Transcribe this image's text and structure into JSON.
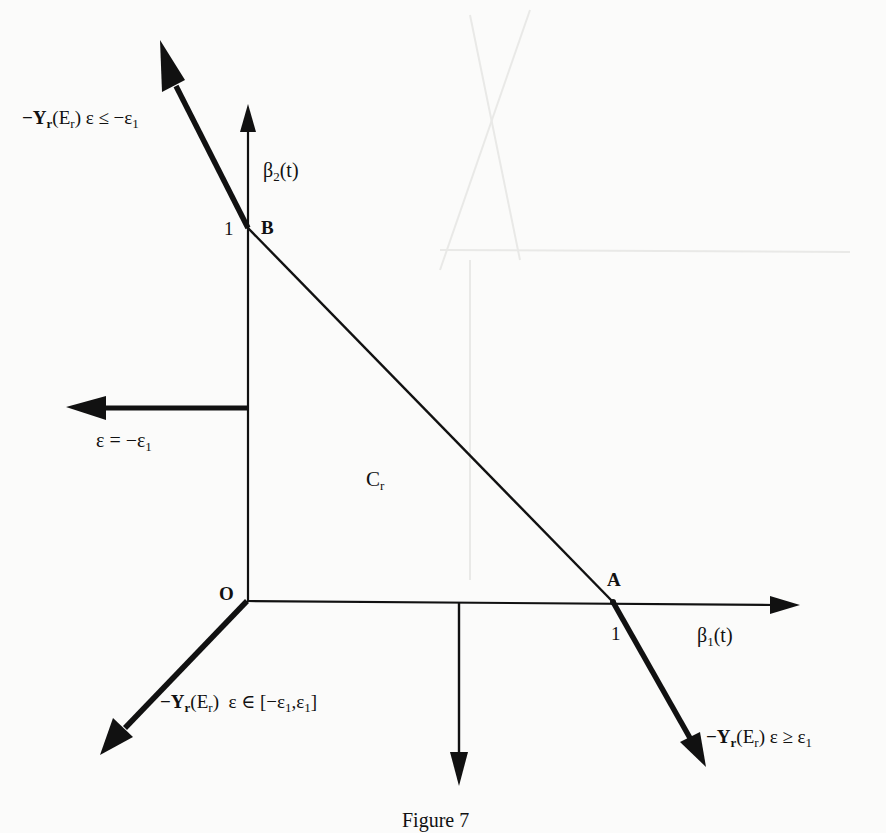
{
  "figure": {
    "caption": "Figure 7",
    "region_label": {
      "main": "C",
      "sub": "r"
    },
    "points": {
      "origin": "O",
      "A": "A",
      "B": "B"
    },
    "tick_labels": {
      "x_one": "1",
      "y_one": "1"
    },
    "axes": {
      "x": {
        "main": "β",
        "sub": "1",
        "tail": "(t)"
      },
      "y": {
        "main": "β",
        "sub": "2",
        "tail": "(t)"
      }
    },
    "arrow_labels": {
      "top_left": {
        "prefix": "−Y",
        "sub1": "r",
        "mid": "(E",
        "sub2": "r",
        "close": ")",
        "cond": " ε ≤ −ε",
        "sub3": "1"
      },
      "left": {
        "text": "ε = −ε",
        "sub": "1"
      },
      "bottom_left": {
        "prefix": "−Y",
        "sub1": "r",
        "mid": "(E",
        "sub2": "r",
        "close": ")",
        "cond": "  ε ∈ [−ε",
        "sub3": "1",
        "rest": ",ε",
        "sub4": "1",
        "end": "]"
      },
      "bottom_right": {
        "prefix": "−Y",
        "sub1": "r",
        "mid": "(E",
        "sub2": "r",
        "close": ")",
        "cond": " ε ≥ ε",
        "sub3": "1"
      }
    },
    "colors": {
      "ink": "#111111",
      "paper": "#fbfbfa"
    }
  }
}
